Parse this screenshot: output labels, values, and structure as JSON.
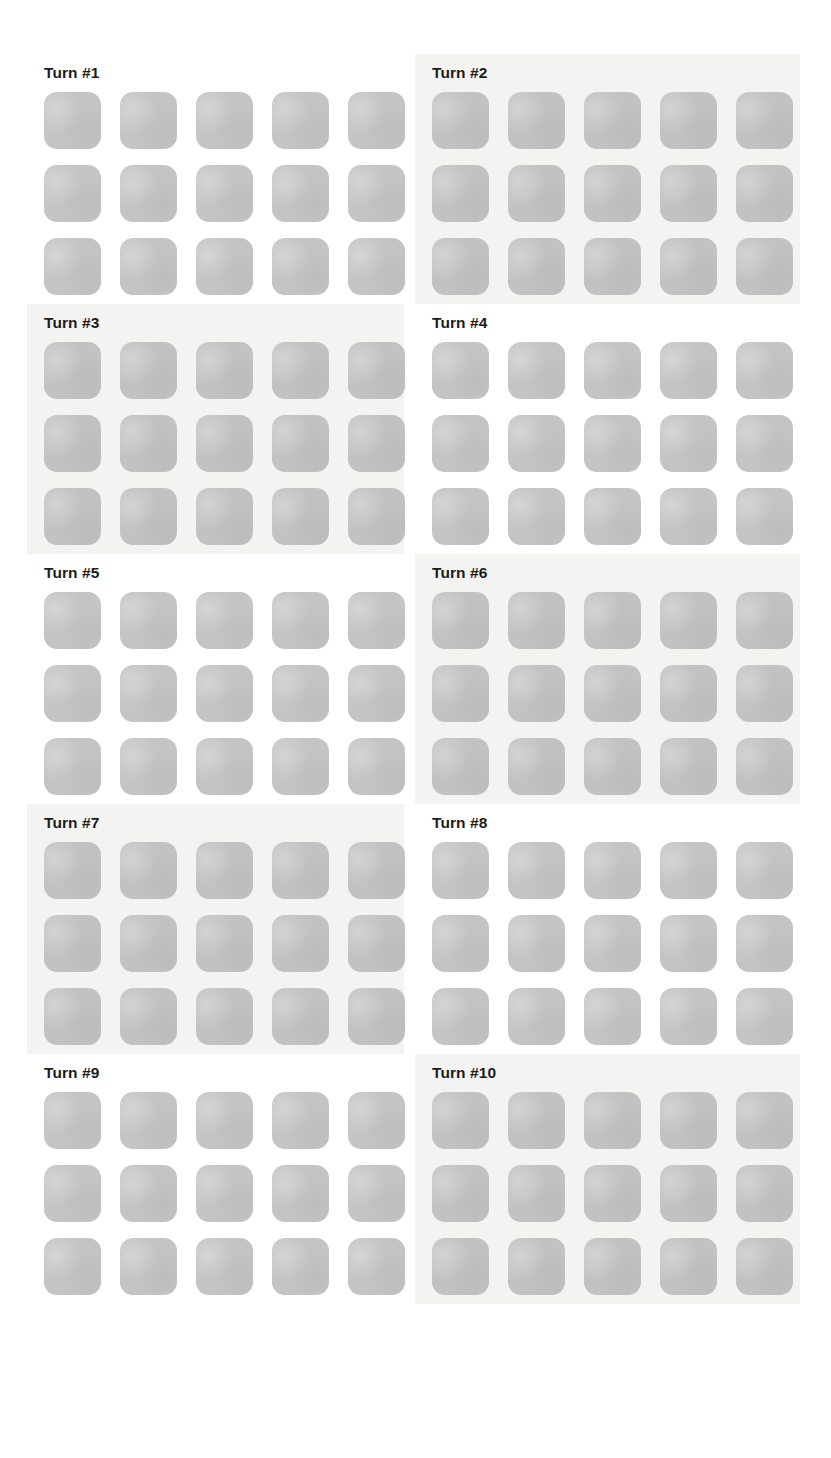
{
  "page": {
    "background_color": "#ffffff",
    "shaded_panel_color": "#f3f3f2",
    "tile_color": "#c4c4c4",
    "title_color": "#1c1c1c",
    "columns": 2,
    "rows": 5
  },
  "panels": [
    {
      "title": "Turn #1",
      "shaded": false,
      "grid": {
        "rows": 3,
        "cols": 5,
        "tiles": [
          [
            "blank",
            "blank",
            "blank",
            "blank",
            "blank"
          ],
          [
            "blank",
            "blank",
            "blank",
            "blank",
            "blank"
          ],
          [
            "blank",
            "blank",
            "blank",
            "blank",
            "blank"
          ]
        ]
      }
    },
    {
      "title": "Turn #2",
      "shaded": true,
      "grid": {
        "rows": 3,
        "cols": 5,
        "tiles": [
          [
            "blank",
            "blank",
            "blank",
            "blank",
            "blank"
          ],
          [
            "blank",
            "blank",
            "blank",
            "blank",
            "blank"
          ],
          [
            "blank",
            "blank",
            "blank",
            "blank",
            "blank"
          ]
        ]
      }
    },
    {
      "title": "Turn #3",
      "shaded": true,
      "grid": {
        "rows": 3,
        "cols": 5,
        "tiles": [
          [
            "blank",
            "blank",
            "blank",
            "blank",
            "blank"
          ],
          [
            "blank",
            "blank",
            "blank",
            "blank",
            "blank"
          ],
          [
            "blank",
            "blank",
            "blank",
            "blank",
            "blank"
          ]
        ]
      }
    },
    {
      "title": "Turn #4",
      "shaded": false,
      "grid": {
        "rows": 3,
        "cols": 5,
        "tiles": [
          [
            "blank",
            "blank",
            "blank",
            "blank",
            "blank"
          ],
          [
            "blank",
            "blank",
            "blank",
            "blank",
            "blank"
          ],
          [
            "blank",
            "blank",
            "blank",
            "blank",
            "blank"
          ]
        ]
      }
    },
    {
      "title": "Turn #5",
      "shaded": false,
      "grid": {
        "rows": 3,
        "cols": 5,
        "tiles": [
          [
            "blank",
            "blank",
            "blank",
            "blank",
            "blank"
          ],
          [
            "blank",
            "blank",
            "blank",
            "blank",
            "blank"
          ],
          [
            "blank",
            "blank",
            "blank",
            "blank",
            "blank"
          ]
        ]
      }
    },
    {
      "title": "Turn #6",
      "shaded": true,
      "grid": {
        "rows": 3,
        "cols": 5,
        "tiles": [
          [
            "blank",
            "blank",
            "blank",
            "blank",
            "blank"
          ],
          [
            "blank",
            "blank",
            "blank",
            "blank",
            "blank"
          ],
          [
            "blank",
            "blank",
            "blank",
            "blank",
            "blank"
          ]
        ]
      }
    },
    {
      "title": "Turn #7",
      "shaded": true,
      "grid": {
        "rows": 3,
        "cols": 5,
        "tiles": [
          [
            "blank",
            "blank",
            "blank",
            "blank",
            "blank"
          ],
          [
            "blank",
            "blank",
            "blank",
            "blank",
            "blank"
          ],
          [
            "blank",
            "blank",
            "blank",
            "blank",
            "blank"
          ]
        ]
      }
    },
    {
      "title": "Turn #8",
      "shaded": false,
      "grid": {
        "rows": 3,
        "cols": 5,
        "tiles": [
          [
            "blank",
            "blank",
            "blank",
            "blank",
            "blank"
          ],
          [
            "blank",
            "blank",
            "blank",
            "blank",
            "blank"
          ],
          [
            "blank",
            "blank",
            "blank",
            "blank",
            "blank"
          ]
        ]
      }
    },
    {
      "title": "Turn #9",
      "shaded": false,
      "grid": {
        "rows": 3,
        "cols": 5,
        "tiles": [
          [
            "blank",
            "blank",
            "blank",
            "blank",
            "blank"
          ],
          [
            "blank",
            "blank",
            "blank",
            "blank",
            "blank"
          ],
          [
            "blank",
            "blank",
            "blank",
            "blank",
            "blank"
          ]
        ]
      }
    },
    {
      "title": "Turn #10",
      "shaded": true,
      "grid": {
        "rows": 3,
        "cols": 5,
        "tiles": [
          [
            "blank",
            "blank",
            "blank",
            "blank",
            "blank"
          ],
          [
            "blank",
            "blank",
            "blank",
            "blank",
            "blank"
          ],
          [
            "blank",
            "blank",
            "blank",
            "blank",
            "blank"
          ]
        ]
      }
    }
  ]
}
